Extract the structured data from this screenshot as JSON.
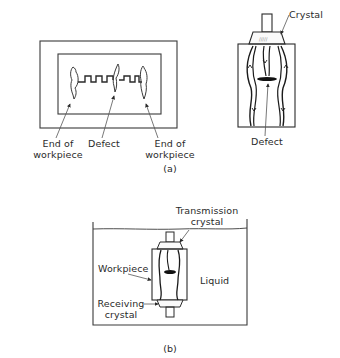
{
  "figure": {
    "part_a": {
      "caption": "(a)",
      "left_diagram": {
        "labels": {
          "end_left_line1": "End of",
          "end_left_line2": "workpiece",
          "defect": "Defect",
          "end_right_line1": "End of",
          "end_right_line2": "workpiece"
        }
      },
      "right_diagram": {
        "labels": {
          "crystal": "Crystal",
          "defect": "Defect"
        }
      }
    },
    "part_b": {
      "caption": "(b)",
      "labels": {
        "transmission_line1": "Transmission",
        "transmission_line2": "crystal",
        "workpiece": "Workpiece",
        "liquid": "Liquid",
        "receiving_line1": "Receiving",
        "receiving_line2": "crystal"
      }
    },
    "colors": {
      "line": "#2a2a2a",
      "thin_line": "#555555",
      "background": "#ffffff"
    }
  }
}
